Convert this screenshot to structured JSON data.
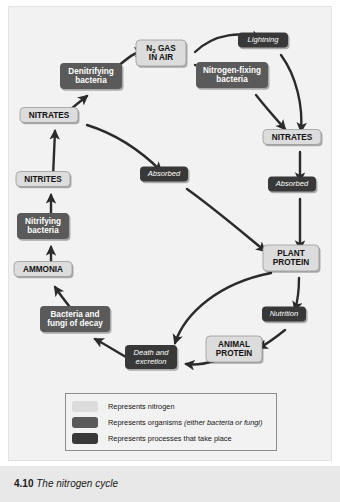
{
  "figure": {
    "caption_number": "4.10",
    "caption_title": "The nitrogen cycle"
  },
  "colors": {
    "nitrogen_fill": "#dcdcdc",
    "organism_fill": "#5a5a5a",
    "process_fill": "#383838",
    "arrow": "#2b2b2b",
    "panel_background": "#f2f2f2",
    "caption_band": "#e8e8e8"
  },
  "legend": {
    "items": [
      {
        "swatch": "#dcdcdc",
        "label": "Represents nitrogen",
        "emphasis": ""
      },
      {
        "swatch": "#5a5a5a",
        "label": "Represents organisms ",
        "emphasis": "(either bacteria or fungi)"
      },
      {
        "swatch": "#383838",
        "label": "Represents processes that take place",
        "emphasis": ""
      }
    ]
  },
  "diagram": {
    "type": "cycle-diagram",
    "nodes": [
      {
        "id": "n2gas",
        "label_line1": "N",
        "subscript": "2",
        "label_line1b": " GAS",
        "label_line2": "IN AIR",
        "kind": "nitrogen",
        "x": 160,
        "y": 52,
        "w": 50,
        "h": 26
      },
      {
        "id": "lightning",
        "label_line1": "Lightning",
        "label_line2": "",
        "kind": "process",
        "x": 262,
        "y": 39,
        "w": 50,
        "h": 15
      },
      {
        "id": "denitrifying",
        "label_line1": "Denitrifying",
        "label_line2": "bacteria",
        "kind": "organism",
        "x": 90,
        "y": 75,
        "w": 62,
        "h": 26
      },
      {
        "id": "nfixing",
        "label_line1": "Nitrogen-fixing",
        "label_line2": "bacteria",
        "kind": "organism",
        "x": 231,
        "y": 74,
        "w": 72,
        "h": 26
      },
      {
        "id": "nitrates_l",
        "label_line1": "NITRATES",
        "label_line2": "",
        "kind": "nitrogen",
        "x": 48,
        "y": 114,
        "w": 58,
        "h": 15
      },
      {
        "id": "nitrates_r",
        "label_line1": "NITRATES",
        "label_line2": "",
        "kind": "nitrogen",
        "x": 291,
        "y": 136,
        "w": 58,
        "h": 15
      },
      {
        "id": "absorbed_c",
        "label_line1": "Absorbed",
        "label_line2": "",
        "kind": "process",
        "x": 163,
        "y": 173,
        "w": 48,
        "h": 15
      },
      {
        "id": "absorbed_r",
        "label_line1": "Absorbed",
        "label_line2": "",
        "kind": "process",
        "x": 291,
        "y": 183,
        "w": 48,
        "h": 15
      },
      {
        "id": "nitrites",
        "label_line1": "NITRITES",
        "label_line2": "",
        "kind": "nitrogen",
        "x": 42,
        "y": 178,
        "w": 54,
        "h": 15
      },
      {
        "id": "nitrifying",
        "label_line1": "Nitrifying",
        "label_line2": "bacteria",
        "kind": "organism",
        "x": 42,
        "y": 225,
        "w": 52,
        "h": 26
      },
      {
        "id": "ammonia",
        "label_line1": "AMMONIA",
        "label_line2": "",
        "kind": "nitrogen",
        "x": 42,
        "y": 268,
        "w": 58,
        "h": 15
      },
      {
        "id": "plant",
        "label_line1": "PLANT",
        "label_line2": "PROTEIN",
        "kind": "nitrogen",
        "x": 290,
        "y": 257,
        "w": 56,
        "h": 26
      },
      {
        "id": "decay",
        "label_line1": "Bacteria and",
        "label_line2": "fungi of decay",
        "kind": "organism",
        "x": 74,
        "y": 318,
        "w": 70,
        "h": 26
      },
      {
        "id": "nutrition",
        "label_line1": "Nutrition",
        "label_line2": "",
        "kind": "process",
        "x": 283,
        "y": 313,
        "w": 44,
        "h": 15
      },
      {
        "id": "death",
        "label_line1": "Death and",
        "label_line2": "excretion",
        "kind": "process",
        "x": 150,
        "y": 356,
        "w": 52,
        "h": 24
      },
      {
        "id": "animal",
        "label_line1": "ANIMAL",
        "label_line2": "PROTEIN",
        "kind": "nitrogen",
        "x": 233,
        "y": 348,
        "w": 56,
        "h": 26
      }
    ],
    "edges": [
      {
        "from": "denitrifying",
        "to": "n2gas",
        "path": "M 108,60 C 120,50 126,45 134,44"
      },
      {
        "from": "nitrates_l",
        "to": "denitrifying",
        "path": "M 58,106 C 66,98 72,94 78,89"
      },
      {
        "from": "n2gas",
        "to": "lightning",
        "path": "M 186,45 C 206,26 234,24 250,32"
      },
      {
        "from": "n2gas",
        "to": "nfixing",
        "path": "M 186,58 C 198,63 206,65 214,66"
      },
      {
        "from": "lightning",
        "to": "nitrates_r",
        "path": "M 272,48 C 288,70 294,100 292,124"
      },
      {
        "from": "nfixing",
        "to": "nitrates_r",
        "path": "M 247,88 C 258,102 268,113 276,122"
      },
      {
        "from": "nitrates_r",
        "to": "absorbed_r",
        "path": "M 291,145 L 291,174"
      },
      {
        "from": "absorbed_r",
        "to": "plant",
        "path": "M 291,192 L 291,242"
      },
      {
        "from": "nitrates_l",
        "to": "absorbed_c",
        "path": "M 78,118 C 110,128 136,148 152,164"
      },
      {
        "from": "absorbed_c",
        "to": "plant",
        "path": "M 178,182 C 206,202 234,226 256,244"
      },
      {
        "from": "nitrites",
        "to": "nitrates_l",
        "path": "M 44,170 L 46,124"
      },
      {
        "from": "nitrifying",
        "to": "nitrites",
        "path": "M 42,211 L 42,188"
      },
      {
        "from": "ammonia",
        "to": "nitrifying",
        "path": "M 42,260 L 42,240"
      },
      {
        "from": "decay",
        "to": "ammonia",
        "path": "M 64,304 C 56,294 50,286 46,280"
      },
      {
        "from": "death",
        "to": "decay",
        "path": "M 124,354 C 106,344 94,336 86,332"
      },
      {
        "from": "animal",
        "to": "death",
        "path": "M 205,354 C 192,358 184,358 177,357"
      },
      {
        "from": "plant",
        "to": "death",
        "path": "M 262,266 C 210,276 176,306 166,336"
      },
      {
        "from": "plant",
        "to": "nutrition",
        "path": "M 290,271 C 290,286 288,296 286,303"
      },
      {
        "from": "nutrition",
        "to": "animal",
        "path": "M 276,323 C 266,331 258,337 250,341"
      }
    ]
  }
}
